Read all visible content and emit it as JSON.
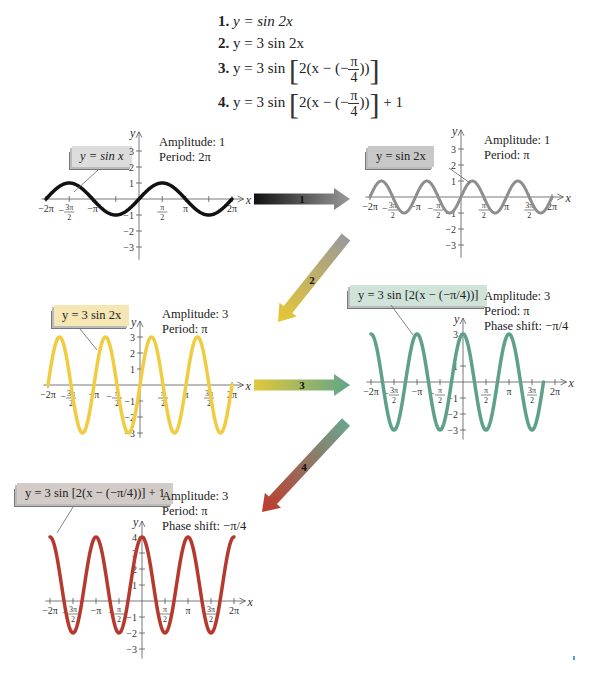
{
  "header_caption": "graph",
  "equations": [
    {
      "num": "1.",
      "prefix": "y = sin 2x"
    },
    {
      "num": "2.",
      "prefix": "y = 3 sin 2x"
    },
    {
      "num": "3.",
      "prefix": "y = 3 sin",
      "inner": "2(x − (−",
      "frac_num": "π",
      "frac_den": "4",
      "close": "))",
      "suffix": ""
    },
    {
      "num": "4.",
      "prefix": "y = 3 sin",
      "inner": "2(x − (−",
      "frac_num": "π",
      "frac_den": "4",
      "close": "))",
      "suffix": "+ 1"
    }
  ],
  "arrows": [
    {
      "label": "1",
      "from": "#111111",
      "to": "#9a9a9a"
    },
    {
      "label": "2",
      "from": "#9a9a9a",
      "to": "#e8c832"
    },
    {
      "label": "3",
      "from": "#e0c83a",
      "to": "#5fa58a"
    },
    {
      "label": "4",
      "from": "#6aa58e",
      "to": "#c0392b"
    }
  ],
  "graphs": [
    {
      "id": "g1",
      "label": "y = sin x",
      "label_bg": "#dcdcdc",
      "info": [
        "Amplitude: 1",
        "Period: 2π"
      ],
      "color": "#111111",
      "stroke_width": 3.5,
      "origin": [
        139,
        199
      ],
      "px_per_pi": 46.5,
      "px_per_unit": 16,
      "x_ticks": [
        "−2π",
        "−3π/2",
        "−π",
        "",
        "",
        "π/2",
        "π",
        "",
        "2π"
      ],
      "x_tick_labels_shown": [
        "−2π",
        "−3π/2",
        "−π",
        "π/2",
        "π",
        "2π"
      ],
      "y_ticks": [
        3,
        2,
        1,
        -1,
        -2,
        -3
      ],
      "y_range": [
        -3.8,
        4.2
      ],
      "func": "sin x"
    },
    {
      "id": "g2",
      "label": "y = sin 2x",
      "label_bg": "#c8c8c8",
      "info": [
        "Amplitude: 1",
        "Period: π"
      ],
      "color": "#8e8e8e",
      "stroke_width": 3,
      "origin": [
        461,
        197
      ],
      "px_per_pi": 45.5,
      "px_per_unit": 16,
      "x_tick_labels_shown": [
        "−2π",
        "−3π/2",
        "−π",
        "−π/2",
        "π/2",
        "π",
        "3π/2",
        "2π"
      ],
      "y_ticks": [
        3,
        2,
        1,
        -1,
        -2,
        -3
      ],
      "y_range": [
        -3.8,
        4.2
      ],
      "func": "sin 2x"
    },
    {
      "id": "g3",
      "label": "y = 3 sin 2x",
      "label_bg": "#f5e6b4",
      "info": [
        "Amplitude: 3",
        "Period: π"
      ],
      "color": "#f0cc40",
      "stroke_width": 3.5,
      "origin": [
        140,
        385
      ],
      "px_per_pi": 46,
      "px_per_unit": 16,
      "x_tick_labels_shown": [
        "−2π",
        "−3π/2",
        "−π",
        "−π/2",
        "π/2",
        "π",
        "3π/2",
        "2π"
      ],
      "y_ticks": [
        3,
        2,
        1,
        -1,
        -2,
        -3
      ],
      "y_range": [
        -3.3,
        4.0
      ],
      "func": "3 sin 2x"
    },
    {
      "id": "g4",
      "label": "y = 3 sin [2(x − (−π/4))]",
      "label_bg": "#cfe3d9",
      "info": [
        "Amplitude: 3",
        "Period: π",
        "Phase shift: −π/4"
      ],
      "color": "#5fa08a",
      "stroke_width": 3.5,
      "origin": [
        463,
        382
      ],
      "px_per_pi": 46,
      "px_per_unit": 16,
      "x_tick_labels_shown": [
        "−2π",
        "−3π/2",
        "−π",
        "−π/2",
        "π/2",
        "π",
        "3π/2",
        "2π"
      ],
      "y_ticks": [
        3,
        1,
        -1,
        -2,
        -3
      ],
      "y_range": [
        -3.6,
        4.0
      ],
      "func": "3 sin(2(x + π/4))"
    },
    {
      "id": "g5",
      "label": "y = 3 sin [2(x − (−π/4))] + 1",
      "label_bg": "#d2cbc8",
      "info": [
        "Amplitude: 3",
        "Period: π",
        "Phase shift: −π/4"
      ],
      "color": "#b5392c",
      "stroke_width": 3.5,
      "origin": [
        142,
        601
      ],
      "px_per_pi": 46,
      "px_per_unit": 16,
      "x_tick_labels_shown": [
        "−2π",
        "−3π/2",
        "−π",
        "−π/2",
        "π/2",
        "π",
        "3π/2",
        "2π"
      ],
      "y_ticks": [
        4,
        3,
        2,
        1,
        -1,
        -2,
        -3
      ],
      "y_range": [
        -3.6,
        5.0
      ],
      "func": "3 sin(2(x + π/4)) + 1"
    }
  ],
  "axis_labels": {
    "x": "x",
    "y": "y"
  },
  "chart_data": [
    {
      "type": "line",
      "title": "y = sin x",
      "xlabel": "x",
      "ylabel": "y",
      "xlim": [
        "−2π",
        "2π"
      ],
      "ylim": [
        -3,
        3
      ],
      "amplitude": 1,
      "period": "2π",
      "x": [
        "−2π",
        "−3π/2",
        "−π",
        "−π/2",
        "0",
        "π/2",
        "π",
        "3π/2",
        "2π"
      ],
      "y": [
        0,
        1,
        0,
        -1,
        0,
        1,
        0,
        -1,
        0
      ]
    },
    {
      "type": "line",
      "title": "y = sin 2x",
      "xlabel": "x",
      "ylabel": "y",
      "xlim": [
        "−2π",
        "2π"
      ],
      "ylim": [
        -3,
        3
      ],
      "amplitude": 1,
      "period": "π",
      "x": [
        "−2π",
        "−7π/4",
        "−3π/2",
        "−5π/4",
        "−π",
        "−3π/4",
        "−π/2",
        "−π/4",
        "0",
        "π/4",
        "π/2",
        "3π/4",
        "π",
        "5π/4",
        "3π/2",
        "7π/4",
        "2π"
      ],
      "y": [
        0,
        1,
        0,
        -1,
        0,
        1,
        0,
        -1,
        0,
        1,
        0,
        -1,
        0,
        1,
        0,
        -1,
        0
      ]
    },
    {
      "type": "line",
      "title": "y = 3 sin 2x",
      "xlabel": "x",
      "ylabel": "y",
      "xlim": [
        "−2π",
        "2π"
      ],
      "ylim": [
        -3,
        3
      ],
      "amplitude": 3,
      "period": "π",
      "x": [
        "−2π",
        "−7π/4",
        "−3π/2",
        "−5π/4",
        "−π",
        "−3π/4",
        "−π/2",
        "−π/4",
        "0",
        "π/4",
        "π/2",
        "3π/4",
        "π",
        "5π/4",
        "3π/2",
        "7π/4",
        "2π"
      ],
      "y": [
        0,
        3,
        0,
        -3,
        0,
        3,
        0,
        -3,
        0,
        3,
        0,
        -3,
        0,
        3,
        0,
        -3,
        0
      ]
    },
    {
      "type": "line",
      "title": "y = 3 sin [2(x − (−π/4))]",
      "xlabel": "x",
      "ylabel": "y",
      "xlim": [
        "−2π",
        "2π"
      ],
      "ylim": [
        -3,
        3
      ],
      "amplitude": 3,
      "period": "π",
      "phase_shift": "−π/4",
      "x": [
        "−2π",
        "−7π/4",
        "−3π/2",
        "−5π/4",
        "−π",
        "−3π/4",
        "−π/2",
        "−π/4",
        "0",
        "π/4",
        "π/2",
        "3π/4",
        "π",
        "5π/4",
        "3π/2",
        "7π/4"
      ],
      "y": [
        3,
        0,
        -3,
        0,
        3,
        0,
        -3,
        0,
        3,
        0,
        -3,
        0,
        3,
        0,
        -3,
        0
      ]
    },
    {
      "type": "line",
      "title": "y = 3 sin [2(x − (−π/4))] + 1",
      "xlabel": "x",
      "ylabel": "y",
      "xlim": [
        "−2π",
        "2π"
      ],
      "ylim": [
        -3,
        4
      ],
      "amplitude": 3,
      "period": "π",
      "phase_shift": "−π/4",
      "vertical_shift": 1,
      "x": [
        "−2π",
        "−3π/2",
        "−π",
        "−π/2",
        "0",
        "π/2",
        "π",
        "3π/2",
        "2π"
      ],
      "y": [
        4,
        -2,
        4,
        -2,
        4,
        -2,
        4,
        -2,
        4
      ]
    }
  ]
}
